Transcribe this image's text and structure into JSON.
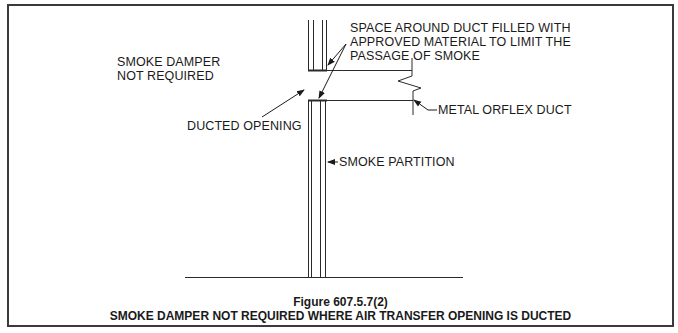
{
  "figure": {
    "number": "Figure 607.5.7(2)",
    "title": "SMOKE DAMPER NOT REQUIRED WHERE AIR TRANSFER OPENING IS DUCTED"
  },
  "labels": {
    "smoke_damper_line1": "SMOKE DAMPER",
    "smoke_damper_line2": "NOT REQUIRED",
    "space_line1": "SPACE AROUND DUCT FILLED WITH",
    "space_line2": "APPROVED MATERIAL TO LIMIT THE",
    "space_line3": "PASSAGE OF SMOKE",
    "ducted_opening": "DUCTED OPENING",
    "metal_duct": "METAL ORFLEX DUCT",
    "smoke_partition": "SMOKE PARTITION"
  },
  "colors": {
    "line": "#2a2a2a",
    "border": "#3a3a3a",
    "background": "#ffffff"
  }
}
